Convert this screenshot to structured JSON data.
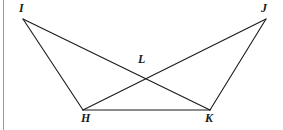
{
  "figure": {
    "type": "geometry-diagram",
    "background_color": "#ffffff",
    "stroke_color": "#1a1a1a",
    "stroke_width": 1.1,
    "left_rule_color": "#9a9a9a",
    "canvas": {
      "width": 283,
      "height": 130
    },
    "vertices": [
      {
        "id": "I",
        "label": "I",
        "x": 23,
        "y": 19,
        "label_x": 19,
        "label_y": 2
      },
      {
        "id": "J",
        "label": "J",
        "x": 266,
        "y": 19,
        "label_x": 261,
        "label_y": 2
      },
      {
        "id": "L",
        "label": "L",
        "x": 145,
        "y": 78,
        "label_x": 138,
        "label_y": 53
      },
      {
        "id": "H",
        "label": "H",
        "x": 83,
        "y": 110,
        "label_x": 81,
        "label_y": 112
      },
      {
        "id": "K",
        "label": "K",
        "x": 210,
        "y": 110,
        "label_x": 205,
        "label_y": 112
      }
    ],
    "segments": [
      {
        "id": "IH",
        "from": "I",
        "to": "H",
        "x1": 23,
        "y1": 19,
        "x2": 83,
        "y2": 110
      },
      {
        "id": "IK",
        "from": "I",
        "to": "K",
        "x1": 23,
        "y1": 19,
        "x2": 210,
        "y2": 110
      },
      {
        "id": "JK",
        "from": "J",
        "to": "K",
        "x1": 266,
        "y1": 19,
        "x2": 210,
        "y2": 110
      },
      {
        "id": "JH",
        "from": "J",
        "to": "H",
        "x1": 266,
        "y1": 19,
        "x2": 83,
        "y2": 110
      },
      {
        "id": "HK",
        "from": "H",
        "to": "K",
        "x1": 83,
        "y1": 110,
        "x2": 210,
        "y2": 110
      }
    ],
    "intersection": {
      "id": "L",
      "of": [
        "IK",
        "JH"
      ],
      "x": 145,
      "y": 78
    }
  }
}
